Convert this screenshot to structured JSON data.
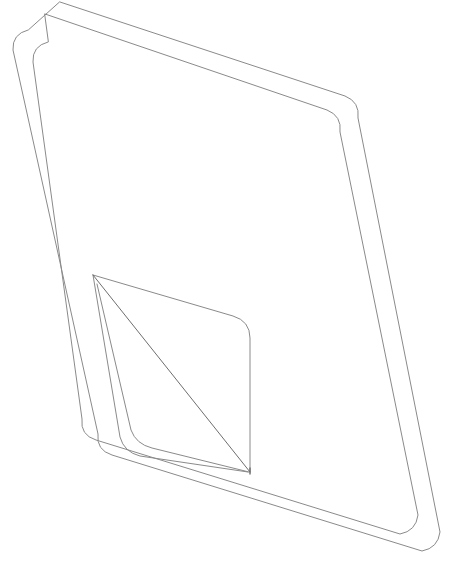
{
  "document": {
    "title": "Technical Line Drawing",
    "description": "Wireframe outline drawing of a tilted rounded sheet with an inner panel and a folded triangular corner flap",
    "background_color": "#ffffff",
    "canvas": {
      "width": 467,
      "height": 582
    }
  },
  "style": {
    "stroke_color": "#8a8a8a",
    "stroke_color_dark": "#6e6e6e",
    "stroke_width": 1,
    "fill": "none",
    "line_cap": "round",
    "line_join": "round"
  },
  "shapes": {
    "outer_sheet": {
      "name": "outer-rounded-rectangle",
      "label": "Outer sheet outline",
      "stroke": "#8a8a8a",
      "path": "M 60 2 L 345 96 Q 360 102 358 118 L 440 532 Q 438 548 422 551 L 112 455 Q 96 450 98 434 L 13 50 Q 12 34 28 30 Z",
      "corner_radius": 18
    },
    "inner_sheet": {
      "name": "inner-rounded-rectangle",
      "label": "Inner sheet outline offset from outer",
      "stroke": "#8a8a8a",
      "path": "M 45 14 L 327 110 Q 342 116 340 132 L 418 515 Q 416 531 400 534 L 96 440 Q 80 435 82 419 L 33 62 Q 32 46 48 42 Z",
      "corner_radius": 18
    },
    "flap_panel": {
      "name": "folded-corner-panel",
      "label": "Inner folded flap panel with rounded top-right corner",
      "stroke": "#8a8a8a",
      "apex": {
        "x": 93,
        "y": 275
      },
      "top_right_corner": {
        "x": 240,
        "y": 318
      },
      "right_edge_bottom": {
        "x": 250,
        "y": 472
      },
      "path": "M 93 275 L 233 316 Q 250 321 250 338 L 250 472"
    },
    "flap_left_edge": {
      "name": "flap-left-edge",
      "label": "Left edge of flap running from apex down to bottom curve",
      "stroke": "#8a8a8a",
      "path": "M 93 275 L 120 437 Q 124 452 140 456 L 248 472"
    },
    "flap_inner_edge": {
      "name": "flap-inner-edge",
      "label": "Second inner edge of flap parallel to left edge",
      "stroke": "#8a8a8a",
      "path": "M 97 284 L 131 430 Q 136 444 152 448 L 249 472"
    },
    "fold_diagonal": {
      "name": "diagonal-fold-line",
      "label": "Diagonal crease line from apex to bottom vertex",
      "stroke": "#6e6e6e",
      "from": {
        "x": 93,
        "y": 275
      },
      "to": {
        "x": 250,
        "y": 472
      },
      "path": "M 93 275 L 250 472"
    },
    "bottom_vertex_stem": {
      "name": "bottom-vertex-stem",
      "label": "Short vertical segment at the bottom vertex of the flap",
      "stroke": "#6e6e6e",
      "path": "M 250 468 L 250 474"
    }
  },
  "geometry_notes": {
    "orientation": "Sheet is rotated roughly 18 degrees clockwise",
    "nested_outlines": 2,
    "flap_lines": 4,
    "vertices_labeled": [
      {
        "name": "apex",
        "x": 93,
        "y": 275
      },
      {
        "name": "bottom-vertex",
        "x": 250,
        "y": 472
      },
      {
        "name": "flap-top-right",
        "x": 240,
        "y": 318
      }
    ]
  }
}
